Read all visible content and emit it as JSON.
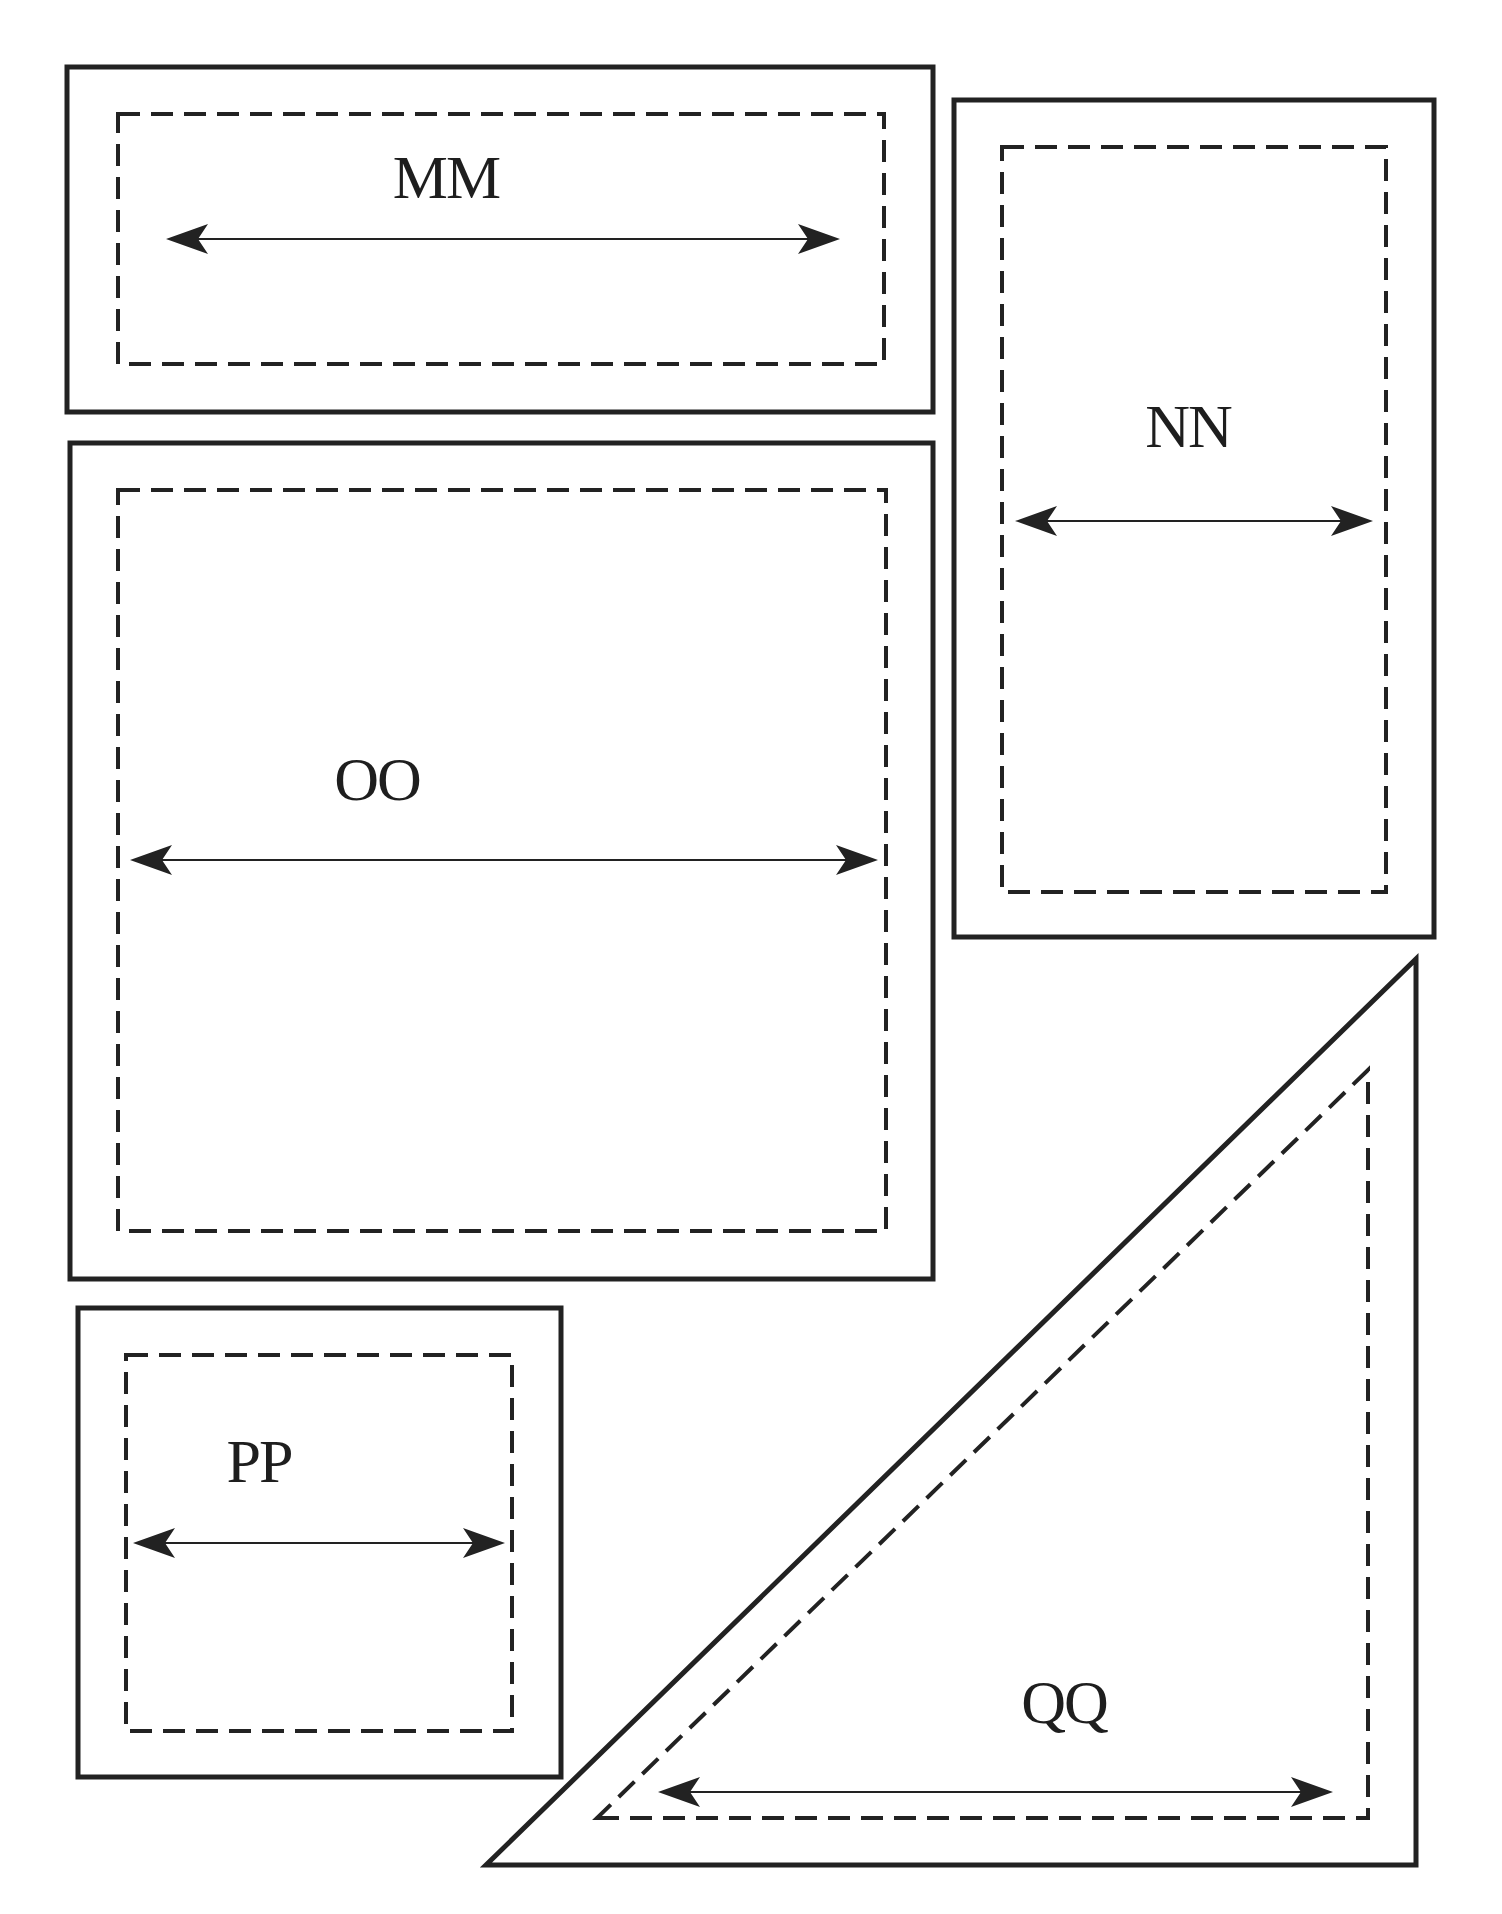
{
  "diagram": {
    "type": "pattern-template-pieces",
    "stroke_color": "#222222",
    "background": "#ffffff",
    "pieces": [
      {
        "id": "MM",
        "label": "MM",
        "shape": "rectangle",
        "outer": {
          "x1": 67,
          "y1": 67,
          "x2": 933,
          "y2": 412
        },
        "inner_dashed": {
          "x1": 118,
          "y1": 114,
          "x2": 884,
          "y2": 364
        },
        "arrow": {
          "y": 239,
          "x1": 166,
          "x2": 840,
          "direction": "both"
        },
        "label_pos": {
          "x": 446,
          "y": 198
        }
      },
      {
        "id": "NN",
        "label": "NN",
        "shape": "rectangle",
        "outer": {
          "x1": 954,
          "y1": 100,
          "x2": 1434,
          "y2": 937
        },
        "inner_dashed": {
          "x1": 1002,
          "y1": 147,
          "x2": 1386,
          "y2": 892
        },
        "arrow": {
          "y": 521,
          "x1": 1015,
          "x2": 1373,
          "direction": "both"
        },
        "label_pos": {
          "x": 1188,
          "y": 447
        }
      },
      {
        "id": "OO",
        "label": "OO",
        "shape": "rectangle",
        "outer": {
          "x1": 70,
          "y1": 443,
          "x2": 933,
          "y2": 1279
        },
        "inner_dashed": {
          "x1": 118,
          "y1": 490,
          "x2": 886,
          "y2": 1231
        },
        "arrow": {
          "y": 860,
          "x1": 130,
          "x2": 878,
          "direction": "both"
        },
        "label_pos": {
          "x": 377,
          "y": 800
        }
      },
      {
        "id": "PP",
        "label": "PP",
        "shape": "rectangle",
        "outer": {
          "x1": 78,
          "y1": 1308,
          "x2": 561,
          "y2": 1777
        },
        "inner_dashed": {
          "x1": 126,
          "y1": 1355,
          "x2": 512,
          "y2": 1731
        },
        "arrow": {
          "y": 1543,
          "x1": 133,
          "x2": 505,
          "direction": "both"
        },
        "label_pos": {
          "x": 259,
          "y": 1482
        }
      },
      {
        "id": "QQ",
        "label": "QQ",
        "shape": "right-triangle",
        "outer_points": [
          [
            486,
            1865
          ],
          [
            1416,
            1865
          ],
          [
            1416,
            959
          ]
        ],
        "inner_dashed_points": [
          [
            597,
            1818
          ],
          [
            1368,
            1818
          ],
          [
            1368,
            1070
          ]
        ],
        "arrow": {
          "y": 1792,
          "x1": 658,
          "x2": 1333,
          "direction": "both"
        },
        "label_pos": {
          "x": 1064,
          "y": 1723
        }
      }
    ]
  }
}
